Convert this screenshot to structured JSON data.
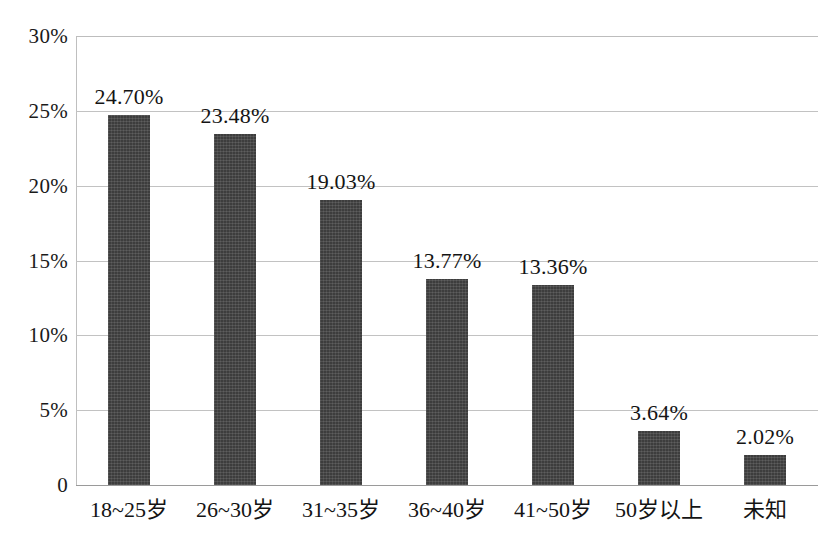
{
  "chart_data": {
    "type": "bar",
    "title": "",
    "subtitle": "",
    "xlabel": "",
    "ylabel": "",
    "categories": [
      "18~25岁",
      "26~30岁",
      "31~35岁",
      "36~40岁",
      "41~50岁",
      "50岁以上",
      "未知"
    ],
    "values": [
      24.7,
      23.48,
      19.03,
      13.77,
      13.36,
      3.64,
      2.02
    ],
    "data_labels": [
      "24.70%",
      "23.48%",
      "19.03%",
      "13.77%",
      "13.36%",
      "3.64%",
      "2.02%"
    ],
    "ylim": [
      0,
      30
    ],
    "ytick_values": [
      30,
      25,
      20,
      15,
      10,
      5,
      0
    ],
    "ytick_labels": [
      "30%",
      "25%",
      "20%",
      "15%",
      "10%",
      "5%",
      "0"
    ],
    "grid": true,
    "grid_axis": "y",
    "legend": false,
    "legend_position": "none",
    "series": [
      {
        "name": "",
        "values": [
          24.7,
          23.48,
          19.03,
          13.77,
          13.36,
          3.64,
          2.02
        ]
      }
    ]
  },
  "style": {
    "bar_color": "#3d3d3d",
    "grid_color": "#c2c2c2",
    "axis_color": "#9a9a9a",
    "text_color": "#141414",
    "background": "#ffffff"
  }
}
